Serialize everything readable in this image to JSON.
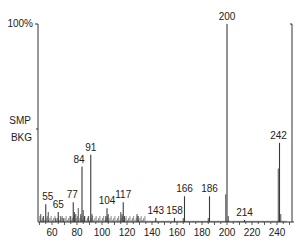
{
  "chart_data": {
    "type": "bar",
    "subtype": "mass-spectrum",
    "title": "",
    "xlabel": "m/z",
    "ylabel": "Relative intensity",
    "y_top_label": "100%",
    "side_labels": [
      "SMP",
      "BKG"
    ],
    "xlim": [
      50,
      250
    ],
    "ylim": [
      0,
      100
    ],
    "x_ticks": [
      60,
      80,
      100,
      120,
      140,
      160,
      180,
      200,
      220,
      240
    ],
    "grid": false,
    "legend": null,
    "labeled_peaks": [
      {
        "mz": 55,
        "intensity": 9,
        "label": "55"
      },
      {
        "mz": 65,
        "intensity": 5,
        "label": "65"
      },
      {
        "mz": 77,
        "intensity": 10,
        "label": "77"
      },
      {
        "mz": 84,
        "intensity": 28,
        "label": "84"
      },
      {
        "mz": 91,
        "intensity": 34,
        "label": "91"
      },
      {
        "mz": 104,
        "intensity": 7,
        "label": "104"
      },
      {
        "mz": 117,
        "intensity": 10,
        "label": "117"
      },
      {
        "mz": 143,
        "intensity": 2,
        "label": "143"
      },
      {
        "mz": 158,
        "intensity": 2,
        "label": "158"
      },
      {
        "mz": 166,
        "intensity": 13,
        "label": "166"
      },
      {
        "mz": 186,
        "intensity": 13,
        "label": "186"
      },
      {
        "mz": 200,
        "intensity": 100,
        "label": "200"
      },
      {
        "mz": 214,
        "intensity": 1,
        "label": "214"
      },
      {
        "mz": 242,
        "intensity": 40,
        "label": "242"
      }
    ],
    "minor_peaks": [
      {
        "mz": 51,
        "intensity": 4
      },
      {
        "mz": 53,
        "intensity": 3
      },
      {
        "mz": 57,
        "intensity": 5
      },
      {
        "mz": 63,
        "intensity": 2
      },
      {
        "mz": 67,
        "intensity": 3
      },
      {
        "mz": 69,
        "intensity": 2
      },
      {
        "mz": 75,
        "intensity": 3
      },
      {
        "mz": 78,
        "intensity": 5
      },
      {
        "mz": 79,
        "intensity": 4
      },
      {
        "mz": 81,
        "intensity": 7
      },
      {
        "mz": 83,
        "intensity": 4
      },
      {
        "mz": 85,
        "intensity": 6
      },
      {
        "mz": 86,
        "intensity": 3
      },
      {
        "mz": 89,
        "intensity": 3
      },
      {
        "mz": 92,
        "intensity": 4
      },
      {
        "mz": 103,
        "intensity": 3
      },
      {
        "mz": 105,
        "intensity": 4
      },
      {
        "mz": 115,
        "intensity": 5
      },
      {
        "mz": 116,
        "intensity": 4
      },
      {
        "mz": 118,
        "intensity": 3
      },
      {
        "mz": 128,
        "intensity": 4
      },
      {
        "mz": 129,
        "intensity": 3
      },
      {
        "mz": 165,
        "intensity": 2
      },
      {
        "mz": 185,
        "intensity": 2
      },
      {
        "mz": 199,
        "intensity": 14
      },
      {
        "mz": 201,
        "intensity": 3
      },
      {
        "mz": 241,
        "intensity": 27
      },
      {
        "mz": 243,
        "intensity": 4
      }
    ]
  },
  "axes": {
    "y_top_label": "100%",
    "smp_label": "SMP",
    "bkg_label": "BKG"
  },
  "colors": {
    "peak": "#3a3a3a",
    "axis": "#333333",
    "text": "#222222"
  }
}
